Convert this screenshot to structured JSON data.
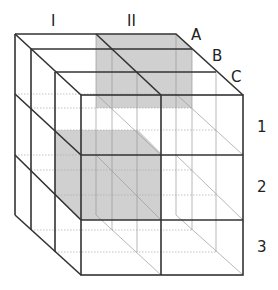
{
  "diagram": {
    "type": "3x3x3 cube grid",
    "column_labels": [
      "I",
      "II"
    ],
    "depth_labels": [
      "A",
      "B",
      "C"
    ],
    "row_labels": [
      "1",
      "2",
      "3"
    ],
    "shaded_regions": [
      {
        "name": "upper-shaded-plane",
        "column": "II",
        "row": "1",
        "color": "#c8c8c8"
      },
      {
        "name": "lower-shaded-plane",
        "column": "I",
        "row": "2",
        "color": "#c8c8c8"
      }
    ]
  }
}
